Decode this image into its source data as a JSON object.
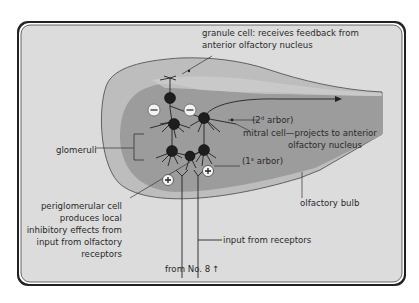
{
  "diagram": {
    "type": "anatomical-schematic",
    "colors": {
      "background": "#dcdcdc",
      "bulb_outer": "#bdbdbd",
      "bulb_inner": "#9c9c9c",
      "band_light": "#cfcfcf",
      "cell": "#1e1e1e",
      "border": "#333333"
    },
    "labels": {
      "granule_line1": "granule cell: receives feedback from",
      "granule_line2": "anterior olfactory nucleus",
      "arbor2": "(2ᵈ arbor)",
      "mitral_line1": "mitral cell—projects to anterior",
      "mitral_line2": "olfactory nucleus",
      "glomeruli": "glomeruli",
      "arbor1": "(1ˢ arbor)",
      "periglom_line1": "periglomerular cell",
      "periglom_line2": "produces local",
      "periglom_line3": "inhibitory effects from",
      "periglom_line4": "input from olfactory",
      "periglom_line5": "receptors",
      "olfactory_bulb": "olfactory bulb",
      "input_receptors": "input from receptors",
      "from_no8": "from No. 8"
    },
    "symbols": {
      "inhibitory": "−",
      "excitatory": "+",
      "up_arrow": "↑"
    }
  }
}
